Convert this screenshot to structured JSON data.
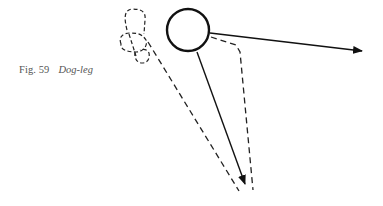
{
  "caption": {
    "number": "Fig. 59",
    "title": "Dog-leg"
  },
  "diagram": {
    "colors": {
      "stroke": "#111111",
      "dashed": "#222222",
      "caption": "#555555",
      "background": "#ffffff"
    },
    "elements": [
      {
        "name": "ball",
        "type": "circle",
        "cx": 188,
        "cy": 30,
        "r": 21
      },
      {
        "name": "direction-arrow",
        "type": "solid-arrow",
        "from": [
          210,
          33
        ],
        "to": [
          362,
          51
        ]
      },
      {
        "name": "cue-path-arrow",
        "type": "solid-arrow",
        "from": [
          197,
          52
        ],
        "to": [
          245,
          183
        ]
      },
      {
        "name": "dogleg-path",
        "type": "dashed",
        "points": [
          [
            211,
            37
          ],
          [
            236,
            45
          ],
          [
            240,
            52
          ],
          [
            253,
            190
          ]
        ]
      },
      {
        "name": "ghost-path",
        "type": "dashed",
        "points": [
          [
            148,
            40
          ],
          [
            238,
            191
          ]
        ]
      },
      {
        "name": "ghost-ball-loops",
        "type": "dashed-loops",
        "center": [
          136,
          40
        ]
      }
    ]
  }
}
